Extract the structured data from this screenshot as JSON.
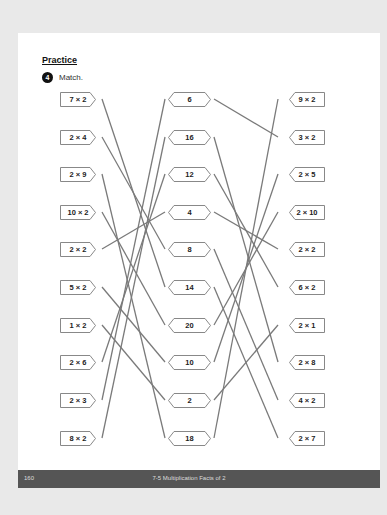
{
  "section_title": "Practice",
  "exercise": {
    "number": "4",
    "instruction": "Match."
  },
  "left_column": [
    "7 × 2",
    "2 × 4",
    "2 × 9",
    "10 × 2",
    "2 × 2",
    "5 × 2",
    "1 × 2",
    "2 × 6",
    "2 × 3",
    "8 × 2"
  ],
  "middle_column": [
    "6",
    "16",
    "12",
    "4",
    "8",
    "14",
    "20",
    "10",
    "2",
    "18"
  ],
  "right_column": [
    "9 × 2",
    "3 × 2",
    "2 × 5",
    "2 × 10",
    "2 × 2",
    "6 × 2",
    "2 × 1",
    "2 × 8",
    "4 × 2",
    "2 × 7"
  ],
  "left_to_middle": [
    [
      0,
      5
    ],
    [
      1,
      4
    ],
    [
      2,
      9
    ],
    [
      3,
      6
    ],
    [
      4,
      3
    ],
    [
      5,
      7
    ],
    [
      6,
      8
    ],
    [
      7,
      2
    ],
    [
      8,
      0
    ],
    [
      9,
      1
    ]
  ],
  "middle_to_right": [
    [
      0,
      1
    ],
    [
      1,
      7
    ],
    [
      2,
      5
    ],
    [
      3,
      4
    ],
    [
      4,
      8
    ],
    [
      5,
      9
    ],
    [
      6,
      3
    ],
    [
      7,
      2
    ],
    [
      8,
      6
    ],
    [
      9,
      0
    ]
  ],
  "footer": {
    "page_number": "160",
    "text": "7-5 Multiplication Facts of 2"
  },
  "colors": {
    "line": "#7a7a7a",
    "footer_bg": "#555555",
    "page_bg": "#ffffff",
    "backdrop": "#e9e9e9"
  }
}
